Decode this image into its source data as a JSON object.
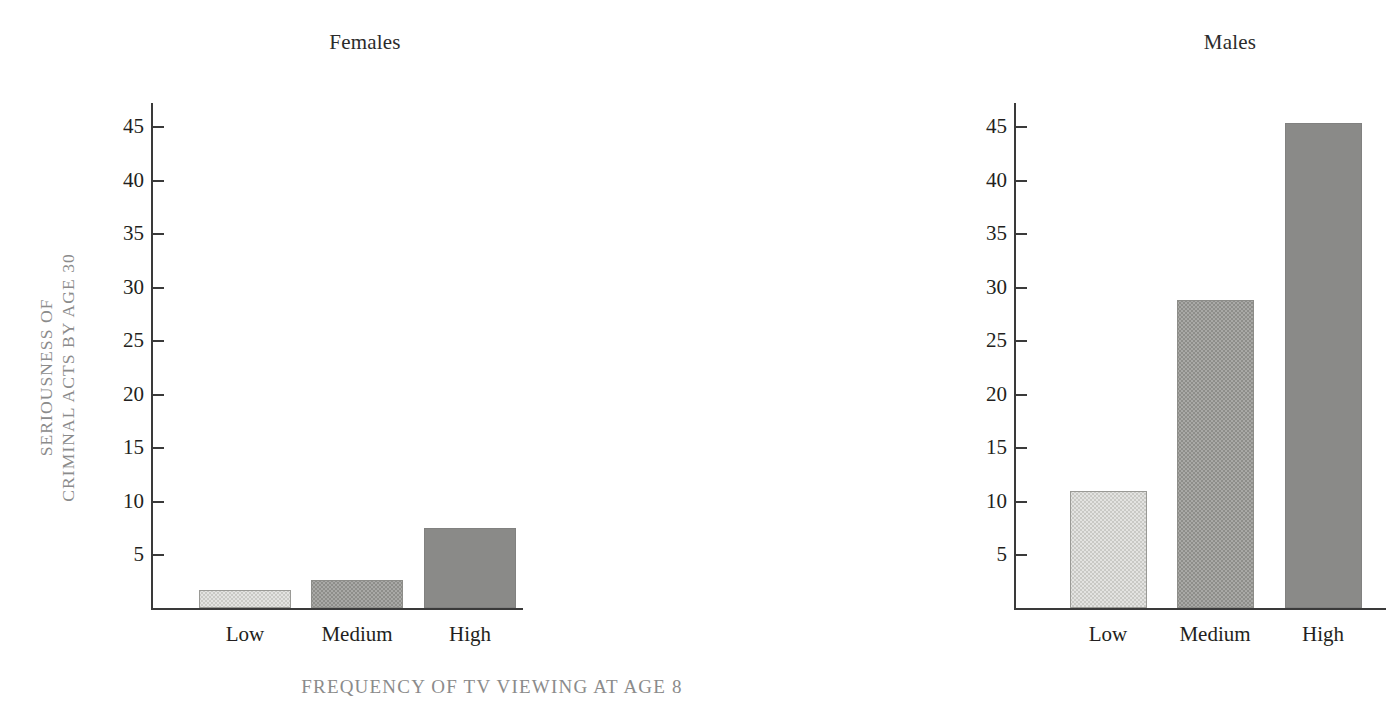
{
  "figure": {
    "panels": [
      {
        "id": "females",
        "title": "Females"
      },
      {
        "id": "males",
        "title": "Males"
      }
    ],
    "ylabel_line1": "SERIOUSNESS OF",
    "ylabel_line2": "CRIMINAL ACTS BY AGE 30",
    "xlabel": "FREQUENCY OF TV VIEWING AT AGE 8",
    "top_remnant": "",
    "colors": {
      "axis": "#3a3a3a",
      "tick_text": "#231f20",
      "panel_title": "#2b2b2b",
      "axis_label": "#8b8b8b",
      "bar_low": "#e3e3e1",
      "bar_medium": "#a9a9a6",
      "bar_high": "#8a8a88"
    },
    "tick_labels": [
      "45",
      "40",
      "35",
      "30",
      "25",
      "20",
      "15",
      "10",
      "5"
    ],
    "category_labels": [
      "Low",
      "Medium",
      "High"
    ]
  },
  "chart_data": {
    "type": "bar",
    "title": "",
    "xlabel": "FREQUENCY OF TV VIEWING AT AGE 8",
    "ylabel": "SERIOUSNESS OF CRIMINAL ACTS BY AGE 30",
    "categories": [
      "Low",
      "Medium",
      "High"
    ],
    "panels": [
      {
        "name": "Females",
        "categories": [
          "Low",
          "Medium",
          "High"
        ],
        "values": [
          1.7,
          2.6,
          7.5
        ]
      },
      {
        "name": "Males",
        "categories": [
          "Low",
          "Medium",
          "High"
        ],
        "values": [
          10.9,
          28.8,
          45.3
        ]
      }
    ],
    "series": [
      {
        "name": "Females",
        "values": [
          1.7,
          2.6,
          7.5
        ]
      },
      {
        "name": "Males",
        "values": [
          10.9,
          28.8,
          45.3
        ]
      }
    ],
    "ylim": [
      0,
      47
    ],
    "yticks": [
      5,
      10,
      15,
      20,
      25,
      30,
      35,
      40,
      45
    ],
    "grid": false,
    "legend": "none"
  }
}
